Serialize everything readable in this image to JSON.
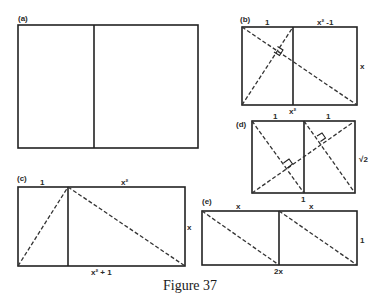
{
  "figure": {
    "caption": "Figure 37",
    "colors": {
      "line": "#222222",
      "background": "#ffffff"
    }
  },
  "panels": {
    "a": {
      "tag": "(a)"
    },
    "b": {
      "tag": "(b)",
      "top_left": "1",
      "top_right": "x² -1",
      "right": "x",
      "bottom": "x²"
    },
    "c": {
      "tag": "(c)",
      "top_left": "1",
      "top_right": "x²",
      "right": "x",
      "bottom": "x² + 1"
    },
    "d": {
      "tag": "(d)",
      "top_left": "1",
      "top_right": "1",
      "right": "√2",
      "bottom": "1"
    },
    "e": {
      "tag": "(e)",
      "top_left": "x",
      "top_right": "x",
      "right": "1",
      "bottom": "2x"
    }
  }
}
